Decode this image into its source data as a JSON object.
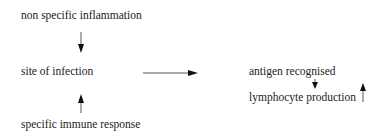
{
  "diagram": {
    "nodes": [
      {
        "id": "inflammation",
        "label": "non specific inflammation"
      },
      {
        "id": "site",
        "label": "site of infection"
      },
      {
        "id": "immune",
        "label": "specific immune response"
      },
      {
        "id": "antigen",
        "label": "antigen recognised"
      },
      {
        "id": "lymphocyte",
        "label": "lymphocyte production"
      }
    ],
    "edges": [
      {
        "from": "inflammation",
        "to": "site",
        "direction": "down"
      },
      {
        "from": "immune",
        "to": "site",
        "direction": "up"
      },
      {
        "from": "site",
        "to": "antigen",
        "direction": "right"
      },
      {
        "from": "antigen",
        "to": "lymphocyte",
        "direction": "down"
      },
      {
        "from": "lymphocyte",
        "to": null,
        "direction": "up",
        "meaning": "increase"
      }
    ]
  },
  "colors": {
    "text": "#222222",
    "arrow": "#111111",
    "background": "#ffffff"
  }
}
